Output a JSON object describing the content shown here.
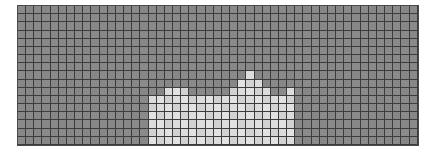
{
  "canvas": {
    "width": 436,
    "height": 160,
    "background": "#ffffff"
  },
  "panel": {
    "name": "heatmap-grid-panel",
    "x": 18,
    "y": 6,
    "width": 400,
    "height": 139,
    "border_color": "#4a4a4a",
    "border_width": 1
  },
  "grid": {
    "columns": 49,
    "rows": 17,
    "cell_width": 8.163,
    "cell_height": 8.176,
    "gridline_color": "#3c3c3c",
    "gridline_width": 1
  },
  "colors": {
    "background_cell": "#8a8a8a",
    "background_cell_alt": "#878787",
    "bright_cell": "#e2e2e2",
    "bright_cell_alt": "#dcdcdc",
    "bright_cell_soft": "#d2d2d2",
    "mid_cell": "#b4b4b4",
    "panel_border": "#4a4a4a",
    "gridline": "#3c3c3c"
  },
  "chart_data": {
    "type": "heatmap",
    "title": "",
    "subtitle": "",
    "xlabel": "",
    "ylabel": "",
    "legend": [],
    "grid": true,
    "colormap": "grayscale",
    "value_low": 0,
    "value_high": 1,
    "n_cols": 49,
    "n_rows": 17,
    "bright_column_heights": [
      {
        "col": 16,
        "top_row": 11,
        "height": 6
      },
      {
        "col": 17,
        "top_row": 11,
        "height": 6
      },
      {
        "col": 18,
        "top_row": 10,
        "height": 7
      },
      {
        "col": 19,
        "top_row": 10,
        "height": 7
      },
      {
        "col": 20,
        "top_row": 10,
        "height": 7
      },
      {
        "col": 21,
        "top_row": 11,
        "height": 6
      },
      {
        "col": 22,
        "top_row": 11,
        "height": 6
      },
      {
        "col": 23,
        "top_row": 11,
        "height": 6
      },
      {
        "col": 24,
        "top_row": 11,
        "height": 6
      },
      {
        "col": 25,
        "top_row": 11,
        "height": 6
      },
      {
        "col": 26,
        "top_row": 10,
        "height": 7
      },
      {
        "col": 27,
        "top_row": 9,
        "height": 8
      },
      {
        "col": 28,
        "top_row": 8,
        "height": 9
      },
      {
        "col": 29,
        "top_row": 9,
        "height": 8
      },
      {
        "col": 30,
        "top_row": 10,
        "height": 7
      },
      {
        "col": 31,
        "top_row": 11,
        "height": 6
      },
      {
        "col": 32,
        "top_row": 11,
        "height": 6
      },
      {
        "col": 33,
        "top_row": 10,
        "height": 7
      }
    ],
    "values_note": "Rows indexed 0 at top. Bright cells approximate value 1.0; background cells approximate value 0.25."
  },
  "bright_cells": [
    [
      11,
      16
    ],
    [
      11,
      17
    ],
    [
      11,
      18
    ],
    [
      11,
      19
    ],
    [
      11,
      20
    ],
    [
      11,
      21
    ],
    [
      11,
      22
    ],
    [
      11,
      23
    ],
    [
      11,
      24
    ],
    [
      11,
      25
    ],
    [
      11,
      26
    ],
    [
      11,
      27
    ],
    [
      11,
      28
    ],
    [
      11,
      29
    ],
    [
      11,
      30
    ],
    [
      11,
      31
    ],
    [
      11,
      32
    ],
    [
      11,
      33
    ],
    [
      12,
      16
    ],
    [
      12,
      17
    ],
    [
      12,
      18
    ],
    [
      12,
      19
    ],
    [
      12,
      20
    ],
    [
      12,
      21
    ],
    [
      12,
      22
    ],
    [
      12,
      23
    ],
    [
      12,
      24
    ],
    [
      12,
      25
    ],
    [
      12,
      26
    ],
    [
      12,
      27
    ],
    [
      12,
      28
    ],
    [
      12,
      29
    ],
    [
      12,
      30
    ],
    [
      12,
      31
    ],
    [
      12,
      32
    ],
    [
      12,
      33
    ],
    [
      13,
      16
    ],
    [
      13,
      17
    ],
    [
      13,
      18
    ],
    [
      13,
      19
    ],
    [
      13,
      20
    ],
    [
      13,
      21
    ],
    [
      13,
      22
    ],
    [
      13,
      23
    ],
    [
      13,
      24
    ],
    [
      13,
      25
    ],
    [
      13,
      26
    ],
    [
      13,
      27
    ],
    [
      13,
      28
    ],
    [
      13,
      29
    ],
    [
      13,
      30
    ],
    [
      13,
      31
    ],
    [
      13,
      32
    ],
    [
      13,
      33
    ],
    [
      14,
      16
    ],
    [
      14,
      17
    ],
    [
      14,
      18
    ],
    [
      14,
      19
    ],
    [
      14,
      20
    ],
    [
      14,
      21
    ],
    [
      14,
      22
    ],
    [
      14,
      23
    ],
    [
      14,
      24
    ],
    [
      14,
      25
    ],
    [
      14,
      26
    ],
    [
      14,
      27
    ],
    [
      14,
      28
    ],
    [
      14,
      29
    ],
    [
      14,
      30
    ],
    [
      14,
      31
    ],
    [
      14,
      32
    ],
    [
      14,
      33
    ],
    [
      15,
      16
    ],
    [
      15,
      17
    ],
    [
      15,
      18
    ],
    [
      15,
      19
    ],
    [
      15,
      20
    ],
    [
      15,
      21
    ],
    [
      15,
      22
    ],
    [
      15,
      23
    ],
    [
      15,
      24
    ],
    [
      15,
      25
    ],
    [
      15,
      26
    ],
    [
      15,
      27
    ],
    [
      15,
      28
    ],
    [
      15,
      29
    ],
    [
      15,
      30
    ],
    [
      15,
      31
    ],
    [
      15,
      32
    ],
    [
      15,
      33
    ],
    [
      16,
      16
    ],
    [
      16,
      17
    ],
    [
      16,
      18
    ],
    [
      16,
      19
    ],
    [
      16,
      20
    ],
    [
      16,
      21
    ],
    [
      16,
      22
    ],
    [
      16,
      23
    ],
    [
      16,
      24
    ],
    [
      16,
      25
    ],
    [
      16,
      26
    ],
    [
      16,
      27
    ],
    [
      16,
      28
    ],
    [
      16,
      29
    ],
    [
      16,
      30
    ],
    [
      16,
      31
    ],
    [
      16,
      32
    ],
    [
      16,
      33
    ],
    [
      10,
      18
    ],
    [
      10,
      19
    ],
    [
      10,
      20
    ],
    [
      10,
      26
    ],
    [
      10,
      27
    ],
    [
      10,
      28
    ],
    [
      10,
      29
    ],
    [
      10,
      30
    ],
    [
      10,
      33
    ],
    [
      9,
      27
    ],
    [
      9,
      28
    ],
    [
      9,
      29
    ],
    [
      8,
      28
    ]
  ]
}
